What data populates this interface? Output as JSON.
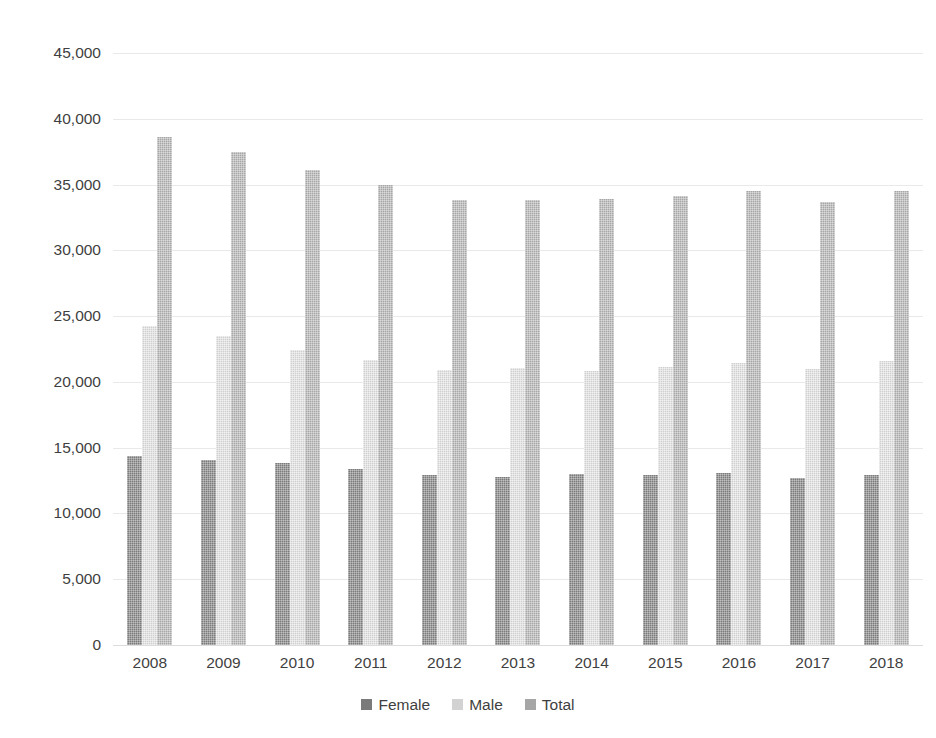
{
  "chart_data": {
    "type": "bar",
    "title": "",
    "subtitle": "",
    "xlabel": "",
    "ylabel": "",
    "categories": [
      "2008",
      "2009",
      "2010",
      "2011",
      "2012",
      "2013",
      "2014",
      "2015",
      "2016",
      "2017",
      "2018"
    ],
    "series": [
      {
        "name": "Female",
        "color": "#7a7a7a",
        "values": [
          14400,
          14050,
          13800,
          13350,
          12900,
          12800,
          13000,
          12950,
          13050,
          12700,
          12950
        ]
      },
      {
        "name": "Male",
        "color": "#d2d2d2",
        "values": [
          24250,
          23500,
          22400,
          21700,
          20900,
          21050,
          20850,
          21100,
          21400,
          20950,
          21600
        ]
      },
      {
        "name": "Total",
        "color": "#a6a6a6",
        "values": [
          38650,
          37450,
          36100,
          35000,
          33800,
          33850,
          33900,
          34150,
          34500,
          33700,
          34500
        ]
      }
    ],
    "ylim": [
      0,
      45000
    ],
    "ytick_values": [
      0,
      5000,
      10000,
      15000,
      20000,
      25000,
      30000,
      35000,
      40000,
      45000
    ],
    "ytick_labels": [
      "0",
      "5,000",
      "10,000",
      "15,000",
      "20,000",
      "25,000",
      "30,000",
      "35,000",
      "40,000",
      "45,000"
    ],
    "grid": true,
    "grid_axis": "y",
    "legend_position": "bottom",
    "background_color": "#ffffff",
    "gridline_color": "#e9e9e9"
  }
}
